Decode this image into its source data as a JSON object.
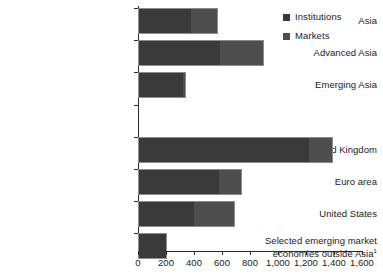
{
  "chart_data": {
    "type": "bar",
    "orientation": "horizontal",
    "stacked": true,
    "title": "",
    "xlabel": "",
    "ylabel": "",
    "xlim": [
      0,
      1600
    ],
    "xticks": [
      0,
      200,
      400,
      600,
      800,
      1000,
      1200,
      1400,
      1600
    ],
    "xtick_labels": [
      "0",
      "200",
      "400",
      "600",
      "800",
      "1,000",
      "1,200",
      "1,400",
      "1,600"
    ],
    "grid": false,
    "legend_position": "top-right",
    "categories": [
      "Asia",
      "Advanced Asia",
      "Emerging Asia",
      "",
      "United Kingdom",
      "Euro area",
      "United States",
      "Selected emerging market economies outside Asia"
    ],
    "category_footnotes": [
      "",
      "",
      "",
      "",
      "",
      "",
      "",
      "1"
    ],
    "series": [
      {
        "name": "Institutions",
        "color": "#3a3a3a",
        "values": [
          380,
          585,
          330,
          null,
          1230,
          585,
          400,
          210
        ]
      },
      {
        "name": "Markets",
        "color": "#4e4e4e",
        "values": [
          190,
          315,
          15,
          null,
          160,
          155,
          290,
          0
        ]
      }
    ],
    "totals": [
      570,
      900,
      345,
      null,
      1390,
      740,
      690,
      210
    ]
  },
  "legend": {
    "items": [
      {
        "label": "Institutions",
        "color": "#3a3a3a",
        "swatch_name": "legend-swatch-institutions"
      },
      {
        "label": "Markets",
        "color": "#4e4e4e",
        "swatch_name": "legend-swatch-markets"
      }
    ]
  },
  "axis": {
    "tick_labels": [
      "0",
      "200",
      "400",
      "600",
      "800",
      "1,000",
      "1,200",
      "1,400",
      "1,600"
    ]
  },
  "rows": [
    {
      "label": "Asia",
      "footnote": "",
      "institutions": 380,
      "markets": 190,
      "gap": false
    },
    {
      "label": "Advanced Asia",
      "footnote": "",
      "institutions": 585,
      "markets": 315,
      "gap": false
    },
    {
      "label": "Emerging Asia",
      "footnote": "",
      "institutions": 330,
      "markets": 15,
      "gap": false
    },
    {
      "label": "",
      "footnote": "",
      "institutions": 0,
      "markets": 0,
      "gap": true
    },
    {
      "label": "United Kingdom",
      "footnote": "",
      "institutions": 1230,
      "markets": 160,
      "gap": false
    },
    {
      "label": "Euro area",
      "footnote": "",
      "institutions": 585,
      "markets": 155,
      "gap": false
    },
    {
      "label": "United States",
      "footnote": "",
      "institutions": 400,
      "markets": 290,
      "gap": false
    },
    {
      "label": "Selected emerging market economies outside Asia",
      "footnote": "1",
      "institutions": 210,
      "markets": 0,
      "gap": false
    }
  ]
}
